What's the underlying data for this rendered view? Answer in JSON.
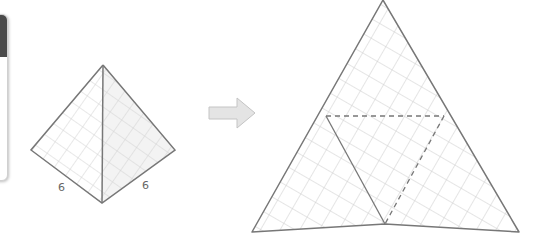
{
  "diagram": {
    "tetrahedron": {
      "edge_labels": [
        "6",
        "6"
      ]
    },
    "arrow": {
      "direction": "right"
    },
    "net": {
      "fold_lines": "dashed",
      "cut_lines": "solid"
    },
    "colors": {
      "edge": "#777777",
      "grid": "#cccccc",
      "arrow_fill": "#e4e4e4",
      "arrow_stroke": "#c4c4c4",
      "side_card_header": "#4a4a4a"
    }
  }
}
